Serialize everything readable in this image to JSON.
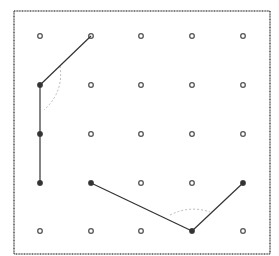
{
  "diagram": {
    "grid": {
      "columns": 5,
      "rows": 5,
      "x": [
        40,
        91,
        141,
        192,
        243
      ],
      "y": [
        36,
        85,
        134,
        183,
        231
      ]
    },
    "frame": {
      "x": 14,
      "y": 11,
      "width": 256,
      "height": 243
    },
    "figures": [
      {
        "name": "angle-left",
        "vertex": [
          0,
          1
        ],
        "points": [
          [
            1,
            0
          ],
          [
            0,
            1
          ],
          [
            0,
            2
          ],
          [
            0,
            3
          ]
        ],
        "segments": [
          [
            [
              1,
              0
            ],
            [
              0,
              1
            ]
          ],
          [
            [
              0,
              1
            ],
            [
              0,
              3
            ]
          ]
        ],
        "filled_points": [
          [
            0,
            1
          ],
          [
            0,
            2
          ],
          [
            0,
            3
          ]
        ],
        "arc": "dashed arc at vertex"
      },
      {
        "name": "angle-bottom",
        "vertex": [
          3,
          4
        ],
        "points": [
          [
            1,
            3
          ],
          [
            3,
            4
          ],
          [
            4,
            3
          ]
        ],
        "segments": [
          [
            [
              1,
              3
            ],
            [
              3,
              4
            ]
          ],
          [
            [
              3,
              4
            ],
            [
              4,
              3
            ]
          ]
        ],
        "filled_points": [
          [
            1,
            3
          ],
          [
            3,
            4
          ],
          [
            4,
            3
          ]
        ],
        "arc": "dashed arc at vertex"
      }
    ],
    "colors": {
      "frame": "#555555",
      "line": "#333333",
      "dot": "#555555",
      "arc": "#bbbbbb"
    }
  }
}
